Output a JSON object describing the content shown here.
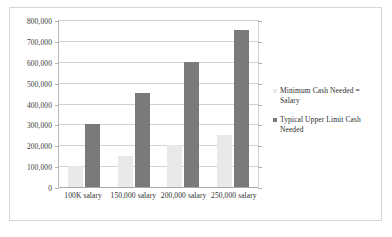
{
  "chart_data": {
    "type": "bar",
    "title": "",
    "xlabel": "",
    "ylabel": "",
    "categories": [
      "100K salary",
      "150,000 salary",
      "200,000 salary",
      "250,000 salary"
    ],
    "series": [
      {
        "name": "Minimum Cash Needed = Salary",
        "color": "#e9e9e9",
        "values": [
          100000,
          150000,
          200000,
          250000
        ]
      },
      {
        "name": "Typical Upper Limit Cash Needed",
        "color": "#7a7a7a",
        "values": [
          300000,
          450000,
          600000,
          750000
        ]
      }
    ],
    "ylim": [
      0,
      800000
    ],
    "y_tick_labels": [
      "800,000",
      "700,000",
      "600,000",
      "500,000",
      "400,000",
      "300,000",
      "200,000",
      "100,000",
      "0"
    ],
    "y_tick_values": [
      800000,
      700000,
      600000,
      500000,
      400000,
      300000,
      200000,
      100000,
      0
    ],
    "grid": true,
    "legend_position": "right"
  },
  "legend": {
    "items": [
      {
        "label": "Minimum Cash Needed = Salary",
        "color": "#e9e9e9"
      },
      {
        "label": "Typical Upper Limit Cash Needed",
        "color": "#7a7a7a"
      }
    ]
  }
}
